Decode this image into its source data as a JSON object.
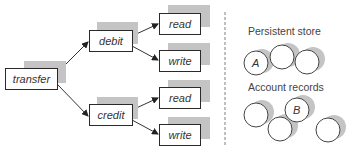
{
  "diagram": {
    "tree": {
      "root": {
        "label": "transfer"
      },
      "children": [
        {
          "label": "debit",
          "children": [
            {
              "label": "read"
            },
            {
              "label": "write"
            }
          ]
        },
        {
          "label": "credit",
          "children": [
            {
              "label": "read"
            },
            {
              "label": "write"
            }
          ]
        }
      ]
    },
    "storage": {
      "persistent_store_label": "Persistent store",
      "account_records_label": "Account records",
      "persistent_circles": [
        {
          "label": "A"
        },
        {
          "label": ""
        },
        {
          "label": ""
        }
      ],
      "account_circles": [
        {
          "label": ""
        },
        {
          "label": "B"
        },
        {
          "label": ""
        },
        {
          "label": ""
        }
      ]
    },
    "colors": {
      "shadow": "#c4c4c4",
      "border": "#2a2a2a",
      "divider": "#aaaaaa"
    }
  }
}
